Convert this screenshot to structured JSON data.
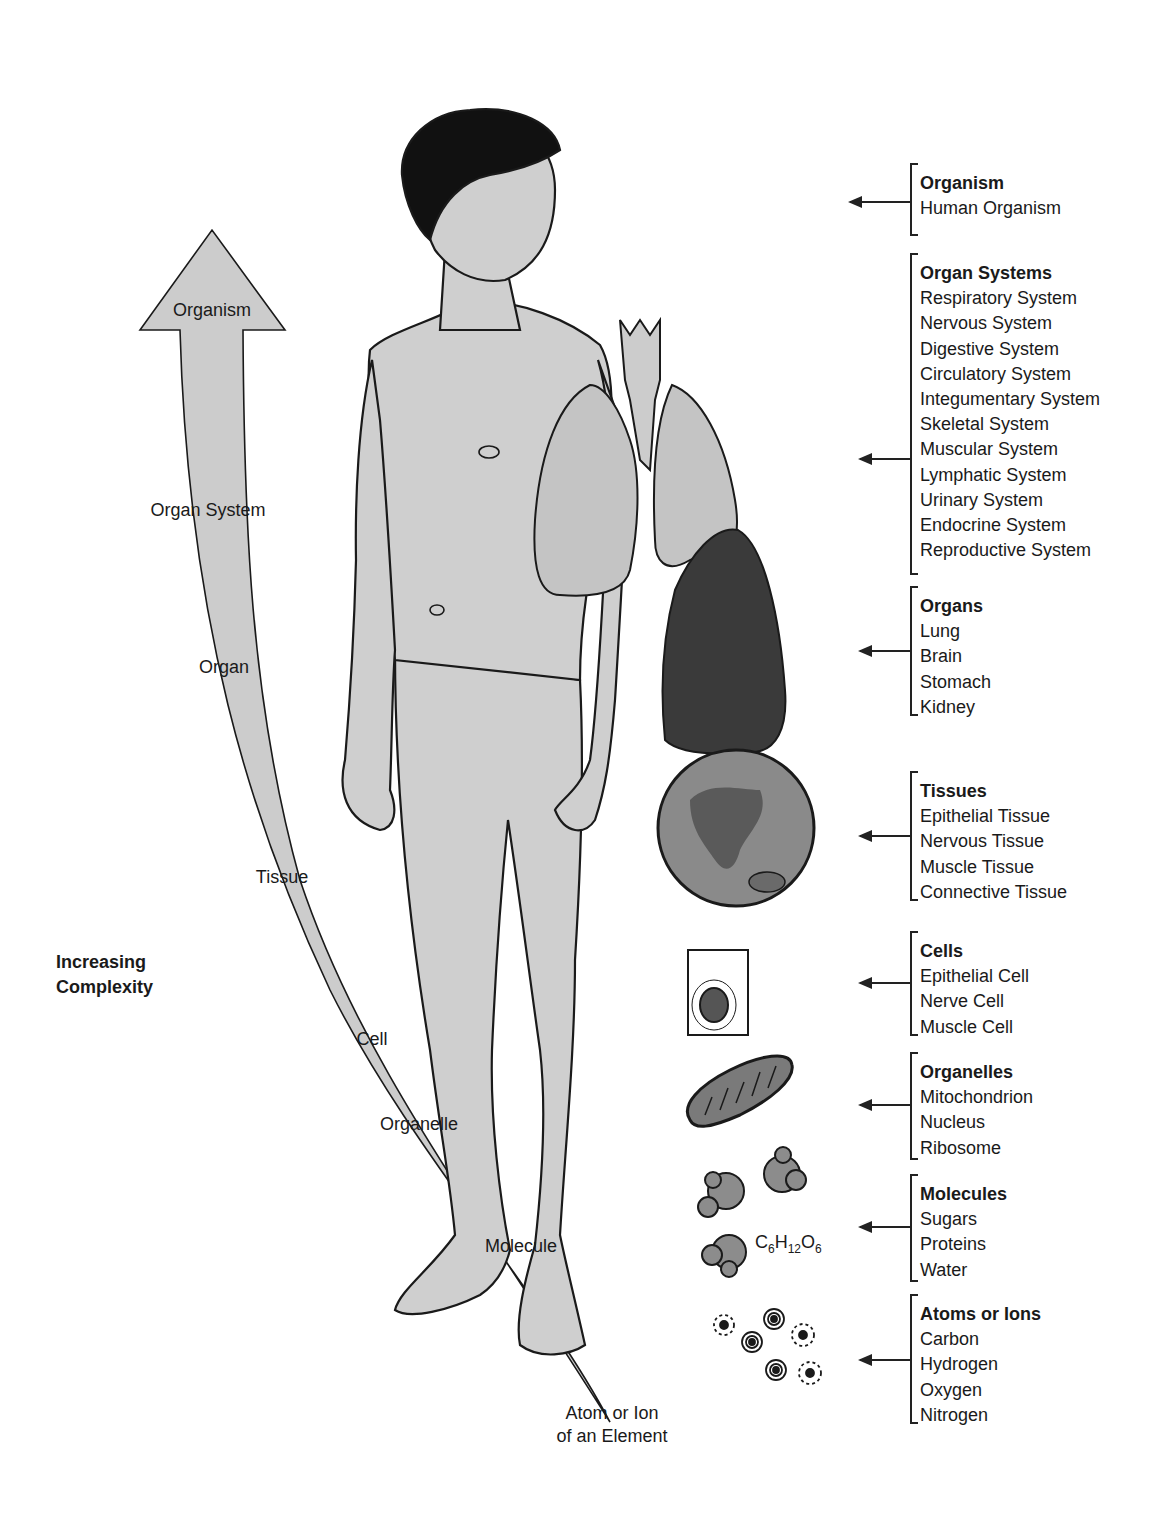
{
  "diagram": {
    "complexity_axis": {
      "label_line1": "Increasing",
      "label_line2": "Complexity",
      "arrow_levels": [
        {
          "label": "Organism",
          "x": 212,
          "y": 310
        },
        {
          "label": "Organ System",
          "x": 208,
          "y": 510
        },
        {
          "label": "Organ",
          "x": 224,
          "y": 667
        },
        {
          "label": "Tissue",
          "x": 282,
          "y": 877
        },
        {
          "label": "Cell",
          "x": 372,
          "y": 1039
        },
        {
          "label": "Organelle",
          "x": 419,
          "y": 1124
        },
        {
          "label": "Molecule",
          "x": 521,
          "y": 1246
        }
      ],
      "base_label_line1": "Atom or Ion",
      "base_label_line2": "of an Element"
    },
    "levels": [
      {
        "title": "Organism",
        "items": [
          "Human Organism"
        ],
        "top": 163,
        "height": 73,
        "arrow_y": 201
      },
      {
        "title": "Organ Systems",
        "items": [
          "Respiratory System",
          "Nervous System",
          "Digestive System",
          "Circulatory System",
          "Integumentary System",
          "Skeletal System",
          "Muscular System",
          "Lymphatic System",
          "Urinary System",
          "Endocrine System",
          "Reproductive System"
        ],
        "top": 253,
        "height": 322,
        "arrow_y": 458
      },
      {
        "title": "Organs",
        "items": [
          "Lung",
          "Brain",
          "Stomach",
          "Kidney"
        ],
        "top": 586,
        "height": 130,
        "arrow_y": 650
      },
      {
        "title": "Tissues",
        "items": [
          "Epithelial Tissue",
          "Nervous Tissue",
          "Muscle Tissue",
          "Connective Tissue"
        ],
        "top": 771,
        "height": 130,
        "arrow_y": 835
      },
      {
        "title": "Cells",
        "items": [
          "Epithelial Cell",
          "Nerve Cell",
          "Muscle Cell"
        ],
        "top": 931,
        "height": 105,
        "arrow_y": 982
      },
      {
        "title": "Organelles",
        "items": [
          "Mitochondrion",
          "Nucleus",
          "Ribosome"
        ],
        "top": 1052,
        "height": 108,
        "arrow_y": 1104
      },
      {
        "title": "Molecules",
        "items": [
          "Sugars",
          "Proteins",
          "Water"
        ],
        "top": 1174,
        "height": 108,
        "arrow_y": 1226
      },
      {
        "title": "Atoms or Ions",
        "items": [
          "Carbon",
          "Hydrogen",
          "Oxygen",
          "Nitrogen"
        ],
        "top": 1294,
        "height": 130,
        "arrow_y": 1359
      }
    ],
    "formula": {
      "c": "C",
      "c_sub": "6",
      "h": "H",
      "h_sub": "12",
      "o": "O",
      "o_sub": "6"
    },
    "colors": {
      "body_fill": "#cfcfcf",
      "arrow_fill": "#cccccc",
      "outline": "#1a1a1a",
      "dark_lung": "#3a3a3a",
      "organ_fill": "#bdbdbd",
      "tissue_fill": "#8a8a8a",
      "hair": "#111111"
    }
  }
}
